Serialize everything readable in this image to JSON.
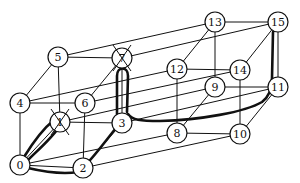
{
  "diagram": {
    "type": "4-dimensional hypercube (tesseract) graph with highlighted path",
    "caption_partial": "",
    "nodes": [
      {
        "id": "0",
        "label": "0",
        "x": 20,
        "y": 165,
        "faulty": false
      },
      {
        "id": "1",
        "label": "1",
        "x": 60,
        "y": 122,
        "faulty": true
      },
      {
        "id": "2",
        "label": "2",
        "x": 83,
        "y": 168,
        "faulty": false
      },
      {
        "id": "3",
        "label": "3",
        "x": 122,
        "y": 123,
        "faulty": false
      },
      {
        "id": "4",
        "label": "4",
        "x": 20,
        "y": 103,
        "faulty": false
      },
      {
        "id": "5",
        "label": "5",
        "x": 58,
        "y": 57,
        "faulty": false
      },
      {
        "id": "6",
        "label": "6",
        "x": 85,
        "y": 103,
        "faulty": false
      },
      {
        "id": "7",
        "label": "7",
        "x": 122,
        "y": 58,
        "faulty": true
      },
      {
        "id": "8",
        "label": "8",
        "x": 177,
        "y": 133,
        "faulty": false
      },
      {
        "id": "9",
        "label": "9",
        "x": 215,
        "y": 87,
        "faulty": false
      },
      {
        "id": "10",
        "label": "10",
        "x": 240,
        "y": 134,
        "faulty": false
      },
      {
        "id": "11",
        "label": "11",
        "x": 278,
        "y": 87,
        "faulty": false
      },
      {
        "id": "12",
        "label": "12",
        "x": 177,
        "y": 69,
        "faulty": false
      },
      {
        "id": "13",
        "label": "13",
        "x": 215,
        "y": 22,
        "faulty": false
      },
      {
        "id": "14",
        "label": "14",
        "x": 240,
        "y": 70,
        "faulty": false
      },
      {
        "id": "15",
        "label": "15",
        "x": 278,
        "y": 22,
        "faulty": false
      }
    ],
    "edges": [
      [
        "0",
        "1"
      ],
      [
        "0",
        "2"
      ],
      [
        "0",
        "4"
      ],
      [
        "1",
        "3"
      ],
      [
        "1",
        "5"
      ],
      [
        "2",
        "3"
      ],
      [
        "2",
        "6"
      ],
      [
        "3",
        "7"
      ],
      [
        "4",
        "5"
      ],
      [
        "4",
        "6"
      ],
      [
        "5",
        "7"
      ],
      [
        "6",
        "7"
      ],
      [
        "8",
        "9"
      ],
      [
        "8",
        "10"
      ],
      [
        "8",
        "12"
      ],
      [
        "9",
        "11"
      ],
      [
        "9",
        "13"
      ],
      [
        "10",
        "11"
      ],
      [
        "10",
        "14"
      ],
      [
        "11",
        "15"
      ],
      [
        "12",
        "13"
      ],
      [
        "12",
        "14"
      ],
      [
        "13",
        "15"
      ],
      [
        "14",
        "15"
      ],
      [
        "0",
        "8"
      ],
      [
        "1",
        "9"
      ],
      [
        "2",
        "10"
      ],
      [
        "3",
        "11"
      ],
      [
        "4",
        "12"
      ],
      [
        "5",
        "13"
      ],
      [
        "6",
        "14"
      ],
      [
        "7",
        "15"
      ]
    ],
    "highlighted_path": [
      "0",
      "1",
      "0",
      "2",
      "3",
      "7",
      "3",
      "11",
      "15"
    ],
    "colors": {
      "line": "#111111",
      "background": "#ffffff",
      "node_fill": "#ffffff"
    }
  }
}
